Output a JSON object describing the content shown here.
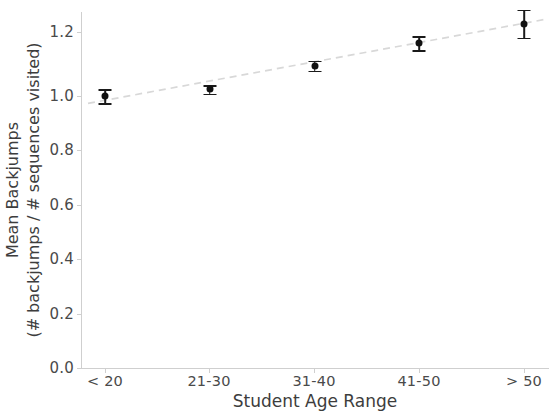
{
  "chart_data": {
    "type": "scatter",
    "title": "",
    "xlabel": "Student Age Range",
    "ylabel_line1": "Mean Backjumps",
    "ylabel_line2": "(# backjumps / # sequences visited)",
    "categories": [
      "< 20",
      "21-30",
      "31-40",
      "41-50",
      "> 50"
    ],
    "values": [
      0.97,
      0.995,
      1.08,
      1.16,
      1.23
    ],
    "errors": [
      0.025,
      0.015,
      0.018,
      0.025,
      0.05
    ],
    "ylim": [
      0.0,
      1.3
    ],
    "yticks": [
      "0.0",
      "0.2",
      "0.4",
      "0.6",
      "0.8",
      "1.0",
      "1.2"
    ],
    "ytick_values": [
      0.0,
      0.2,
      0.4,
      0.6,
      0.8,
      1.0,
      1.2
    ],
    "grid": false,
    "legend": null,
    "series": [
      {
        "name": "Mean backjumps with error bars",
        "marker": "circle",
        "color": "#111111",
        "values": [
          0.97,
          0.995,
          1.08,
          1.16,
          1.23
        ]
      },
      {
        "name": "Linear trend line",
        "style": "dashed",
        "color": "#d8d8d8",
        "y_start": 0.945,
        "y_end": 1.245
      }
    ]
  },
  "axis": {
    "y_tick_labels": [
      "1.2",
      "1.0",
      "0.8",
      "0.6",
      "0.4",
      "0.2",
      "0.0"
    ],
    "x_tick_labels": [
      "< 20",
      "21-30",
      "31-40",
      "41-50",
      "> 50"
    ]
  }
}
